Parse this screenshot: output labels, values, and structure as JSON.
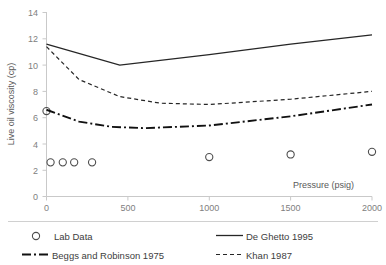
{
  "chart_data": {
    "type": "line",
    "title": "",
    "xlabel": "Pressure (psig)",
    "ylabel": "Live oil viscosity (cp)",
    "xlim": [
      0,
      2000
    ],
    "ylim": [
      0,
      14
    ],
    "xticks": [
      0,
      500,
      1000,
      1500,
      2000
    ],
    "yticks": [
      0,
      2,
      4,
      6,
      8,
      10,
      12,
      14
    ],
    "grid": false,
    "legend_position": "bottom",
    "series": [
      {
        "name": "Lab Data",
        "style": "scatter",
        "marker": "open-circle",
        "color": "#4d4d4d",
        "x": [
          0,
          25,
          100,
          170,
          280,
          1000,
          1500,
          2000
        ],
        "y": [
          6.5,
          2.6,
          2.6,
          2.6,
          2.6,
          3.0,
          3.2,
          3.4
        ]
      },
      {
        "name": "De Ghetto 1995",
        "style": "solid",
        "color": "#262626",
        "x": [
          0,
          450,
          1000,
          1500,
          2000
        ],
        "y": [
          11.6,
          10.0,
          10.8,
          11.6,
          12.3
        ]
      },
      {
        "name": "Khan 1987",
        "style": "dashed",
        "color": "#262626",
        "x": [
          0,
          200,
          450,
          700,
          1000,
          1500,
          2000
        ],
        "y": [
          11.4,
          8.9,
          7.6,
          7.1,
          7.0,
          7.4,
          8.0
        ]
      },
      {
        "name": "Beggs and Robinson 1975",
        "style": "dash-dot",
        "color": "#111111",
        "x": [
          0,
          200,
          400,
          600,
          1000,
          1500,
          2000
        ],
        "y": [
          6.6,
          5.7,
          5.3,
          5.2,
          5.4,
          6.1,
          7.0
        ]
      }
    ]
  },
  "axis": {
    "x_title": "Pressure (psig)",
    "y_title": "Live oil viscosity (cp)",
    "x_tick_labels": [
      "0",
      "500",
      "1000",
      "1500",
      "2000"
    ],
    "y_tick_labels": [
      "0",
      "2",
      "4",
      "6",
      "8",
      "10",
      "12",
      "14"
    ]
  },
  "legend": {
    "entries": [
      {
        "label": "Lab Data",
        "marker": "open-circle"
      },
      {
        "label": "De Ghetto 1995",
        "marker": "solid-line"
      },
      {
        "label": "Beggs and Robinson 1975",
        "marker": "dash-dot-line"
      },
      {
        "label": "Khan 1987",
        "marker": "dashed-line"
      }
    ]
  },
  "colors": {
    "axis": "#c9c9c9",
    "text": "#595959",
    "tick_text": "#808080",
    "series_dark": "#262626",
    "marker": "#4d4d4d"
  }
}
